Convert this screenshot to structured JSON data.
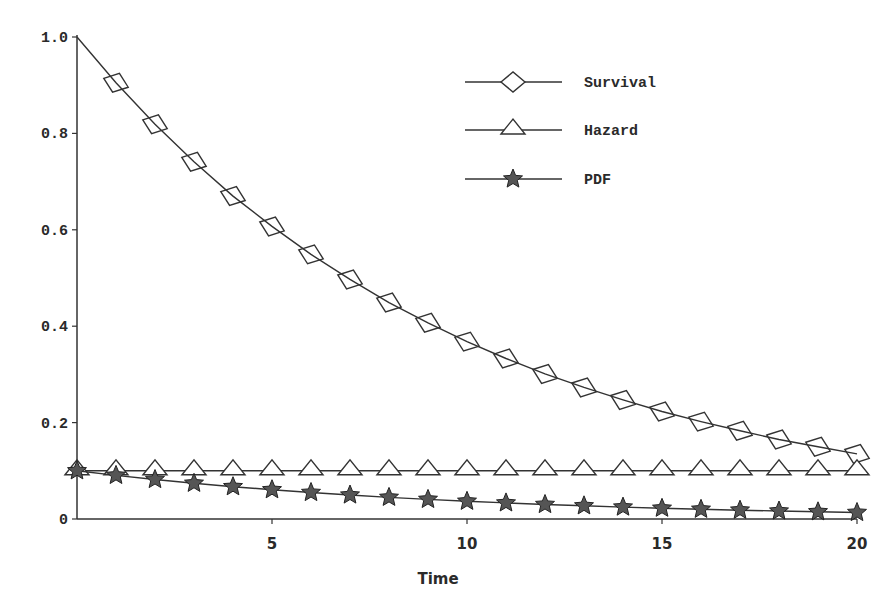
{
  "chart_data": {
    "type": "line",
    "title": "",
    "xlabel": "Time",
    "ylabel": "",
    "xlim": [
      0,
      20
    ],
    "ylim": [
      0,
      1.0
    ],
    "grid": false,
    "legend_position": "upper right",
    "x": [
      0,
      1,
      2,
      3,
      4,
      5,
      6,
      7,
      8,
      9,
      10,
      11,
      12,
      13,
      14,
      15,
      16,
      17,
      18,
      19,
      20
    ],
    "x_ticks": [
      "5",
      "10",
      "15",
      "20"
    ],
    "y_ticks": [
      "0",
      "0.2",
      "0.4",
      "0.6",
      "0.8",
      "1.0"
    ],
    "series": [
      {
        "name": "Survival",
        "marker": "diamond",
        "values": [
          1.0,
          0.905,
          0.819,
          0.741,
          0.67,
          0.607,
          0.549,
          0.497,
          0.449,
          0.407,
          0.368,
          0.333,
          0.301,
          0.273,
          0.247,
          0.223,
          0.202,
          0.183,
          0.165,
          0.15,
          0.135
        ]
      },
      {
        "name": "Hazard",
        "marker": "triangle",
        "values": [
          0.1,
          0.1,
          0.1,
          0.1,
          0.1,
          0.1,
          0.1,
          0.1,
          0.1,
          0.1,
          0.1,
          0.1,
          0.1,
          0.1,
          0.1,
          0.1,
          0.1,
          0.1,
          0.1,
          0.1,
          0.1
        ]
      },
      {
        "name": "PDF",
        "marker": "star",
        "values": [
          0.1,
          0.0905,
          0.0819,
          0.0741,
          0.067,
          0.0607,
          0.0549,
          0.0497,
          0.0449,
          0.0407,
          0.0368,
          0.0333,
          0.0301,
          0.0273,
          0.0247,
          0.0223,
          0.0202,
          0.0183,
          0.0165,
          0.015,
          0.0135
        ]
      }
    ]
  },
  "legend": {
    "items": [
      "Survival",
      "Hazard",
      "PDF"
    ]
  },
  "axes": {
    "xlabel": "Time"
  }
}
